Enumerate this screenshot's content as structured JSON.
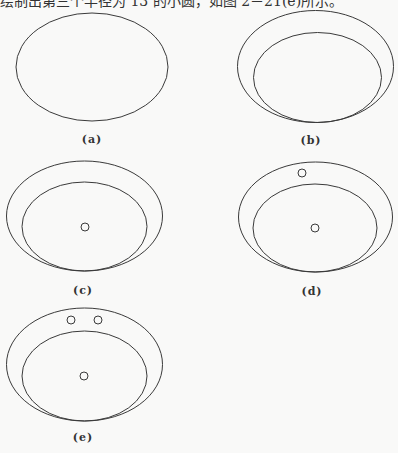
{
  "document": {
    "caption_text": "绘制出第三个半径为 13 的小圆，如图 2－21(e)所示。",
    "stroke_color": "#3a3a3a",
    "figures": [
      {
        "id": "a",
        "label": "(a)",
        "label_pos": [
          92,
          133
        ]
      },
      {
        "id": "b",
        "label": "(b)",
        "label_pos": [
          311,
          134
        ]
      },
      {
        "id": "c",
        "label": "(c)",
        "label_pos": [
          83,
          284
        ]
      },
      {
        "id": "d",
        "label": "(d)",
        "label_pos": [
          312,
          285
        ]
      },
      {
        "id": "e",
        "label": "(e)",
        "label_pos": [
          83,
          431
        ]
      }
    ]
  }
}
